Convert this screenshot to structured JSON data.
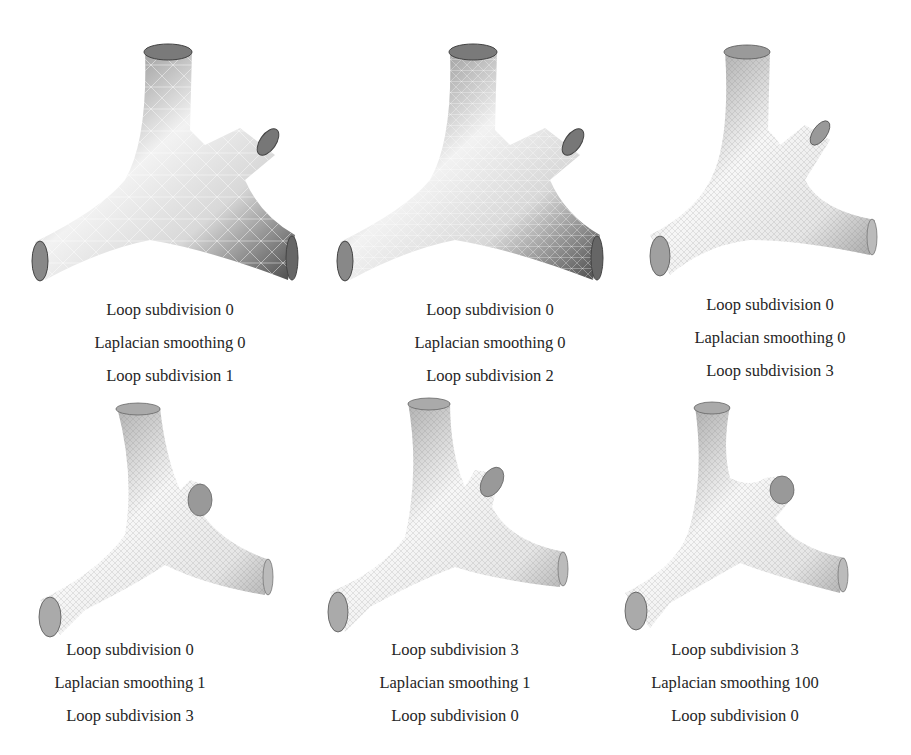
{
  "figure": {
    "panels": [
      {
        "id": "a",
        "row": 1,
        "col": 1,
        "mesh_density": "coarse",
        "shading": "dark",
        "captions": [
          "Loop subdivision 0",
          "Laplacian smoothing 0",
          "Loop subdivision 1"
        ]
      },
      {
        "id": "b",
        "row": 1,
        "col": 2,
        "mesh_density": "medium",
        "shading": "dark",
        "captions": [
          "Loop subdivision 0",
          "Laplacian smoothing 0",
          "Loop subdivision 2"
        ]
      },
      {
        "id": "c",
        "row": 1,
        "col": 3,
        "mesh_density": "fine",
        "shading": "light",
        "captions": [
          "Loop subdivision 0",
          "Laplacian smoothing 0",
          "Loop subdivision 3"
        ]
      },
      {
        "id": "d",
        "row": 2,
        "col": 1,
        "mesh_density": "fine",
        "shading": "light",
        "captions": [
          "Loop subdivision 0",
          "Laplacian smoothing 1",
          "Loop subdivision 3"
        ]
      },
      {
        "id": "e",
        "row": 2,
        "col": 2,
        "mesh_density": "fine",
        "shading": "light",
        "captions": [
          "Loop subdivision 3",
          "Laplacian smoothing 1",
          "Loop subdivision 0"
        ]
      },
      {
        "id": "f",
        "row": 2,
        "col": 3,
        "mesh_density": "fine",
        "shading": "light",
        "captions": [
          "Loop subdivision 3",
          "Laplacian smoothing 100",
          "Loop subdivision 0"
        ]
      }
    ]
  }
}
